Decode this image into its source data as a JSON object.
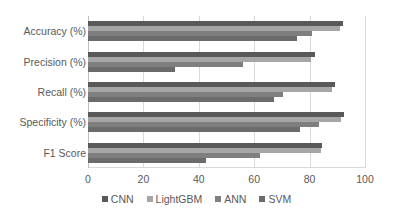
{
  "chart_data": {
    "type": "bar",
    "orientation": "horizontal",
    "title": "",
    "subtitle": "",
    "xlabel": "",
    "ylabel": "",
    "categories": [
      "Accuracy (%)",
      "Precision (%)",
      "Recall (%)",
      "Specificity (%)",
      "F1 Score"
    ],
    "series": [
      {
        "name": "CNN",
        "color": "#595959",
        "values": [
          92.0,
          82.0,
          89.0,
          92.5,
          84.5
        ]
      },
      {
        "name": "LightGBM",
        "color": "#a6a6a6",
        "values": [
          91.0,
          80.5,
          88.0,
          91.5,
          84.0
        ]
      },
      {
        "name": "ANN",
        "color": "#7f7f7f",
        "values": [
          81.0,
          56.0,
          70.5,
          83.5,
          62.0
        ]
      },
      {
        "name": "SVM",
        "color": "#6b6b6b",
        "values": [
          75.5,
          31.5,
          67.0,
          76.5,
          42.5
        ]
      }
    ],
    "xlim": [
      0,
      100
    ],
    "xticks": [
      0,
      20,
      40,
      60,
      80,
      100
    ],
    "xticklabels": [
      "0",
      "20",
      "40",
      "60",
      "80",
      "100"
    ],
    "grid": {
      "vertical": true,
      "horizontal": false,
      "color": "#d9d9d9"
    },
    "legend": {
      "position": "bottom",
      "entries": [
        "CNN",
        "LightGBM",
        "ANN",
        "SVM"
      ]
    },
    "background_color": "#ffffff",
    "text_color": "#595959"
  }
}
